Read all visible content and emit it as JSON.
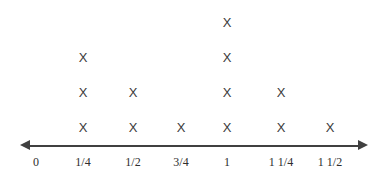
{
  "chart_data": {
    "type": "bar",
    "title": "",
    "subtitle": "",
    "xlabel": "",
    "ylabel": "",
    "categories": [
      "0",
      "1/4",
      "1/2",
      "3/4",
      "1",
      "1 1/4",
      "1 1/2"
    ],
    "values": [
      0,
      3,
      2,
      1,
      4,
      2,
      1
    ],
    "mark": "X",
    "legend": [],
    "annotations": [],
    "grid": false,
    "axis": {
      "arrow_left": true,
      "arrow_right": true,
      "line_color": "#404040",
      "tick_labels": [
        "0",
        "1/4",
        "1/2",
        "3/4",
        "1",
        "1 1/4",
        "1 1/2"
      ]
    },
    "colors": {
      "background": "#ffffff",
      "mark": "#3a3a3a",
      "axis": "#404040",
      "label": "#2e2e2e"
    }
  },
  "columns": [
    {
      "label": "0",
      "count": 0,
      "x": 36,
      "marks": []
    },
    {
      "label": "1/4",
      "count": 3,
      "x": 83,
      "marks": [
        "X",
        "X",
        "X"
      ]
    },
    {
      "label": "1/2",
      "count": 2,
      "x": 133,
      "marks": [
        "X",
        "X"
      ]
    },
    {
      "label": "3/4",
      "count": 1,
      "x": 181,
      "marks": [
        "X"
      ]
    },
    {
      "label": "1",
      "count": 4,
      "x": 227,
      "marks": [
        "X",
        "X",
        "X",
        "X"
      ]
    },
    {
      "label": "1 1/4",
      "count": 2,
      "x": 281,
      "marks": [
        "X",
        "X"
      ]
    },
    {
      "label": "1 1/2",
      "count": 1,
      "x": 330,
      "marks": [
        "X"
      ]
    }
  ]
}
